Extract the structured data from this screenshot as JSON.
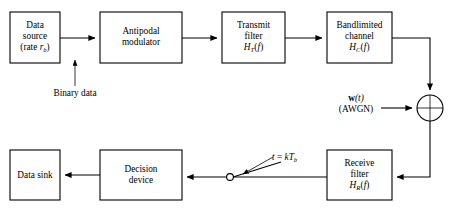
{
  "figure": {
    "type": "block-diagram",
    "width": 453,
    "height": 214,
    "background_color": "#ffffff",
    "line_color": "#000000"
  },
  "blocks": [
    {
      "id": "data-source",
      "lines": [
        "Data",
        "source",
        "(rate r_b)"
      ],
      "line1": "Data",
      "line2": "source",
      "line3_pre": "(rate ",
      "line3_var": "r",
      "line3_sub": "b",
      "line3_post": ")",
      "x": 10,
      "y": 12,
      "w": 50,
      "h": 51
    },
    {
      "id": "antipodal-modulator",
      "line1": "Antipodal",
      "line2": "modulator",
      "x": 100,
      "y": 12,
      "w": 82,
      "h": 51
    },
    {
      "id": "transmit-filter",
      "line1": "Transmit",
      "line2": "filter",
      "line3_var": "H",
      "line3_sub": "T",
      "line3_post_pre": "(",
      "line3_post_var": "f",
      "line3_post_post": ")",
      "x": 222,
      "y": 12,
      "w": 63,
      "h": 51
    },
    {
      "id": "bandlimited-channel",
      "line1": "Bandlimited",
      "line2": "channel",
      "line3_var": "H",
      "line3_sub": "C",
      "line3_post_pre": "(",
      "line3_post_var": "f",
      "line3_post_post": ")",
      "x": 327,
      "y": 12,
      "w": 65,
      "h": 51
    },
    {
      "id": "receive-filter",
      "line1": "Receive",
      "line2": "filter",
      "line3_var": "H",
      "line3_sub": "R",
      "line3_post_pre": "(",
      "line3_post_var": "f",
      "line3_post_post": ")",
      "x": 327,
      "y": 150,
      "w": 65,
      "h": 50
    },
    {
      "id": "decision-device",
      "line1": "Decision",
      "line2": "device",
      "x": 100,
      "y": 150,
      "w": 82,
      "h": 50
    },
    {
      "id": "data-sink",
      "line1": "Data sink",
      "x": 10,
      "y": 150,
      "w": 50,
      "h": 50
    }
  ],
  "labels": {
    "binary_data": "Binary data",
    "noise_symbol": "w",
    "noise_arg": "(t)",
    "noise_kind": "(AWGN)",
    "sampler_label_pre": "t",
    "sampler_label_eq": " = ",
    "sampler_label_k": "k",
    "sampler_label_T": "T",
    "sampler_label_sub": "b"
  },
  "nodes": {
    "summing_junction": {
      "cx": 430,
      "cy": 108,
      "r": 13,
      "operation": "add"
    },
    "sampler_switch": {
      "contact_x": 230,
      "contact_y": 177,
      "arm_end_x": 281,
      "arm_end_y": 162
    }
  }
}
